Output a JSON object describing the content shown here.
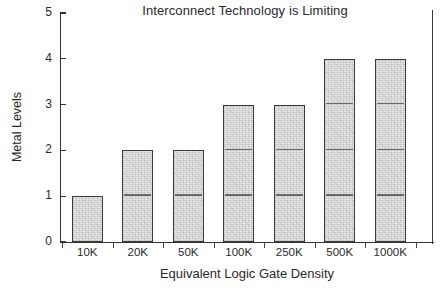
{
  "chart_data": {
    "type": "bar",
    "title": "Interconnect Technology is Limiting",
    "xlabel": "Equivalent Logic Gate Density",
    "ylabel": "Metal Levels",
    "categories": [
      "10K",
      "20K",
      "50K",
      "100K",
      "250K",
      "500K",
      "1000K"
    ],
    "values": [
      1,
      2,
      2,
      3,
      3,
      4,
      4
    ],
    "ylim": [
      0,
      5
    ],
    "ytick_labels": [
      "0",
      "1",
      "2",
      "3",
      "4",
      "5"
    ],
    "yticks": [
      0,
      1,
      2,
      3,
      4,
      5
    ],
    "grid": false,
    "legend": null,
    "colors": {
      "bar_fill": "#e9e9e9",
      "bar_stroke": "#3b3b3b",
      "axis": "#333333",
      "text": "#2a2a2a",
      "background": "#ffffff"
    }
  }
}
